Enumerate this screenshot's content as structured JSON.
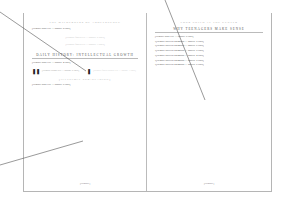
{
  "_note": "Book spread rendered at very low resolution. Only the four headings and the callout glyphs are legible. Values marked [illegible] and the filler lines stand in for body text and folios that cannot be read from the source pixels; they are not transcriptions.",
  "left_page": {
    "running_head": "The Wilderness of Adolescence",
    "intro_paragraph": "[illegible body text — approx. 8 lines]",
    "faded_block_1": "[illegible faded text — approx. 5 lines]",
    "faded_block_2": "[illegible faded text — approx. 3 lines]",
    "section_heading": "Daily History: Intellectual Growth",
    "section_paragraph": "[illegible body text — approx. 4 lines]",
    "callouts": [
      {
        "icon": "❚❚",
        "text": "[illegible callout text — approx. 5 lines]"
      },
      {
        "icon": "❚",
        "text": "[illegible faded callout text — approx. 3 lines]"
      }
    ],
    "sub_heading": "[illegible sub-heading]",
    "closing_paragraph": "[illegible body text — approx. 6 lines]",
    "folio": "[illegible]"
  },
  "right_page": {
    "running_head": "Your Child at the Center",
    "section_heading": "Why Teenagers Make Sense",
    "paragraphs": [
      "[illegible body text — approx. 6 lines]",
      "[illegible bulleted paragraph — approx. 5 lines]",
      "[illegible bulleted paragraph — approx. 6 lines]",
      "[illegible bulleted paragraph — approx. 5 lines]",
      "[illegible bulleted paragraph — approx. 4 lines]",
      "[illegible bulleted paragraph — approx. 5 lines]",
      "[illegible bulleted paragraph — approx. 6 lines]"
    ],
    "bulleted": [
      false,
      true,
      true,
      true,
      true,
      true,
      true
    ],
    "folio": "[illegible]"
  }
}
